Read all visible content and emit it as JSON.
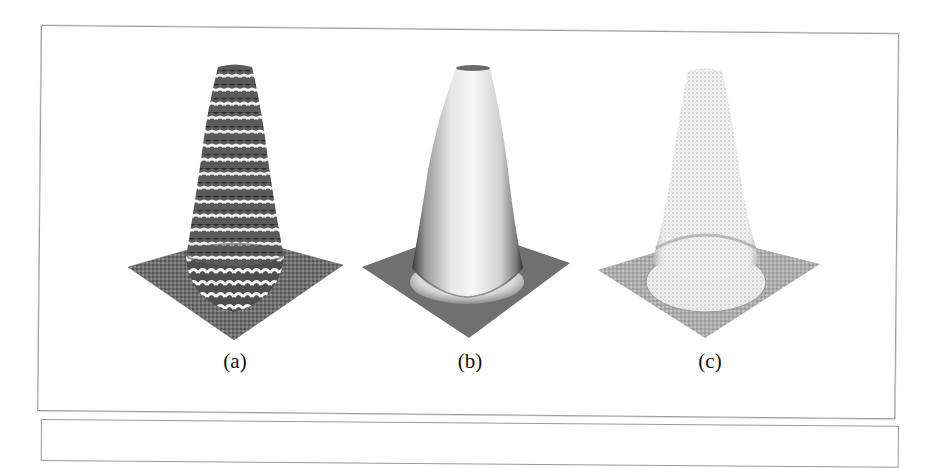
{
  "figure": {
    "panels": [
      {
        "id": "a",
        "label": "(a)",
        "rendering": "wireframe-striped surface",
        "center_x": 235
      },
      {
        "id": "b",
        "label": "(b)",
        "rendering": "smooth-shaded surface",
        "center_x": 470
      },
      {
        "id": "c",
        "label": "(c)",
        "rendering": "point-sampled light surface",
        "center_x": 710
      }
    ],
    "colors": {
      "frame_border": "#9a9a9a",
      "base_plane_a": "#6e6e6e",
      "base_plane_b": "#707070",
      "base_plane_c": "#a8a8a8",
      "label_text": "#111111"
    }
  }
}
